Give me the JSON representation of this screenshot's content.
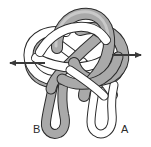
{
  "figure": {
    "kind": "knot-tangle-diagram",
    "width": 151,
    "height": 147,
    "background_color": "#ffffff"
  },
  "colors": {
    "background": "#ffffff",
    "tube_gray_fill": "#a9a9a9",
    "tube_gray_shade": "#8f8f8f",
    "tube_white_fill": "#ffffff",
    "outline": "#2b2b2b",
    "arrow": "#3a3a3a",
    "label": "#2b2b2b"
  },
  "labels": [
    {
      "id": "label-b",
      "text": "B",
      "x": 33,
      "y": 133,
      "strand": "gray"
    },
    {
      "id": "label-a",
      "text": "A",
      "x": 121,
      "y": 133,
      "strand": "white"
    }
  ],
  "arrows": [
    {
      "id": "arrow-left",
      "direction": "left",
      "x_tip": 3,
      "x_tail": 45,
      "y": 63
    },
    {
      "id": "arrow-right",
      "direction": "right",
      "x_tip": 148,
      "x_tail": 112,
      "y": 55
    }
  ],
  "strands": [
    {
      "id": "strand-gray",
      "fill": "#a9a9a9",
      "tail_label": "B"
    },
    {
      "id": "strand-white",
      "fill": "#ffffff",
      "tail_label": "A"
    }
  ]
}
